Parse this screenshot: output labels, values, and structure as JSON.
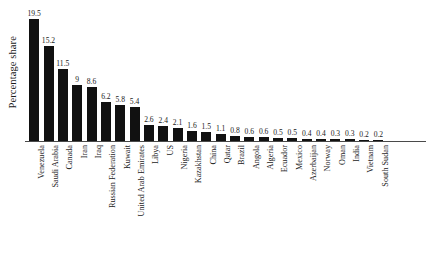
{
  "chart_data": {
    "type": "bar",
    "title": "",
    "subtitle": "",
    "xlabel": "",
    "ylabel": "Percentage share",
    "ylim": [
      0,
      19.5
    ],
    "grid": false,
    "legend": "none",
    "orientation": "vertical",
    "bar_color": "#111111",
    "value_labels_shown": true,
    "categories": [
      "Venezuela",
      "Saudi Arabia",
      "Canada",
      "Iran",
      "Iraq",
      "Russian Federation",
      "Kuwait",
      "United Arab Emirates",
      "Libya",
      "US",
      "Nigeria",
      "Kazakhstan",
      "China",
      "Qatar",
      "Brazil",
      "Angola",
      "Algeria",
      "Ecuador",
      "Mexico",
      "Azerbaijan",
      "Norway",
      "Oman",
      "India",
      "Vietnam",
      "South Sudan"
    ],
    "values": [
      19.5,
      15.2,
      11.5,
      9,
      8.6,
      6.2,
      5.8,
      5.4,
      2.6,
      2.4,
      2.1,
      1.6,
      1.5,
      1.1,
      0.8,
      0.6,
      0.6,
      0.5,
      0.5,
      0.4,
      0.4,
      0.3,
      0.3,
      0.2,
      0.2
    ],
    "value_label_text": [
      "19.5",
      "15.2",
      "11.5",
      "9",
      "8.6",
      "6.2",
      "5.8",
      "5.4",
      "2.6",
      "2.4",
      "2.1",
      "1.6",
      "1.5",
      "1.1",
      "0.8",
      "0.6",
      "0.6",
      "0.5",
      "0.5",
      "0.4",
      "0.4",
      "0.3",
      "0.3",
      "0.2",
      "0.2"
    ]
  }
}
